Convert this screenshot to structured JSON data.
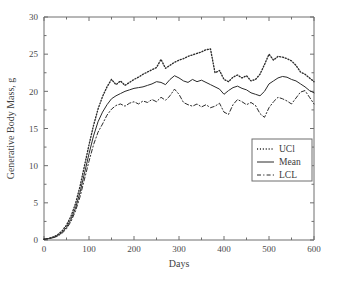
{
  "chart_data": {
    "type": "line",
    "title": "",
    "xlabel": "Days",
    "ylabel": "Generative Body Mass, g",
    "xlim": [
      0,
      600
    ],
    "ylim": [
      0,
      30
    ],
    "xticks": [
      0,
      100,
      200,
      300,
      400,
      500,
      600
    ],
    "yticks": [
      0,
      5,
      10,
      15,
      20,
      25,
      30
    ],
    "xtick_labels": [
      "0",
      "100",
      "200",
      "300",
      "400",
      "500",
      "600"
    ],
    "ytick_labels": [
      "0",
      "5",
      "10",
      "15",
      "20",
      "25",
      "30"
    ],
    "grid": false,
    "legend_position": "center-right",
    "x": [
      0,
      10,
      20,
      30,
      40,
      50,
      60,
      70,
      80,
      90,
      100,
      110,
      120,
      130,
      140,
      150,
      160,
      170,
      180,
      190,
      200,
      210,
      220,
      230,
      240,
      250,
      260,
      270,
      280,
      290,
      300,
      310,
      320,
      330,
      340,
      350,
      360,
      370,
      380,
      390,
      400,
      410,
      420,
      430,
      440,
      450,
      460,
      470,
      480,
      490,
      500,
      510,
      520,
      530,
      540,
      550,
      560,
      570,
      580,
      590,
      600
    ],
    "series": [
      {
        "name": "UCl",
        "style": "dotted",
        "color": "#2b2b2b",
        "values": [
          0.1,
          0.2,
          0.4,
          0.7,
          1.2,
          2.0,
          3.2,
          4.9,
          7.2,
          10.0,
          12.8,
          15.4,
          17.6,
          19.3,
          20.6,
          21.6,
          20.9,
          21.4,
          20.8,
          21.2,
          21.6,
          21.9,
          22.3,
          22.6,
          22.9,
          23.2,
          24.3,
          23.1,
          23.5,
          23.9,
          24.2,
          24.4,
          24.7,
          24.9,
          25.1,
          25.3,
          25.6,
          25.7,
          22.5,
          22.8,
          21.6,
          21.3,
          21.9,
          22.2,
          21.8,
          22.1,
          21.4,
          21.6,
          22.3,
          23.6,
          25.0,
          24.2,
          24.7,
          24.6,
          24.4,
          24.1,
          23.5,
          22.6,
          22.3,
          21.8,
          21.3
        ]
      },
      {
        "name": "Mean",
        "style": "solid",
        "color": "#2b2b2b",
        "values": [
          0.1,
          0.2,
          0.3,
          0.6,
          1.0,
          1.7,
          2.8,
          4.3,
          6.4,
          9.0,
          11.6,
          14.0,
          15.9,
          17.2,
          18.2,
          19.0,
          19.4,
          19.7,
          20.0,
          20.2,
          20.4,
          20.5,
          20.6,
          20.8,
          21.0,
          21.3,
          21.2,
          20.9,
          21.6,
          22.1,
          21.8,
          21.4,
          21.2,
          21.6,
          21.3,
          21.5,
          21.2,
          20.9,
          20.6,
          20.3,
          19.6,
          20.1,
          20.5,
          20.7,
          20.4,
          20.2,
          19.8,
          19.6,
          19.4,
          20.0,
          21.0,
          21.4,
          21.8,
          22.0,
          21.9,
          21.6,
          21.4,
          21.0,
          20.6,
          20.1,
          19.8
        ]
      },
      {
        "name": "LCL",
        "style": "dashed",
        "color": "#2b2b2b",
        "values": [
          0.1,
          0.2,
          0.3,
          0.5,
          0.9,
          1.5,
          2.5,
          3.9,
          5.8,
          8.2,
          10.6,
          12.8,
          14.5,
          15.6,
          16.8,
          17.6,
          18.1,
          18.3,
          18.0,
          18.4,
          18.6,
          18.3,
          18.7,
          18.5,
          18.9,
          18.6,
          19.2,
          18.8,
          19.4,
          20.3,
          19.6,
          18.5,
          18.2,
          18.0,
          18.3,
          17.9,
          18.2,
          17.8,
          18.0,
          18.4,
          17.2,
          16.9,
          18.2,
          18.9,
          18.6,
          18.2,
          18.5,
          18.1,
          17.0,
          16.5,
          17.8,
          18.6,
          19.2,
          19.0,
          18.7,
          18.3,
          19.1,
          19.9,
          20.1,
          19.2,
          18.3
        ]
      }
    ]
  },
  "legend": {
    "items": [
      {
        "label": "UCl",
        "style": "dotted"
      },
      {
        "label": "Mean",
        "style": "solid"
      },
      {
        "label": "LCL",
        "style": "dashed"
      }
    ]
  }
}
